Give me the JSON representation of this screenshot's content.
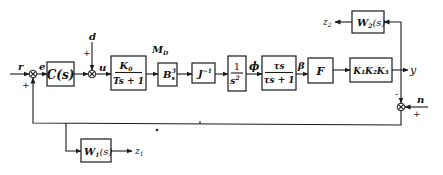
{
  "diagram": {
    "type": "control-system block diagram",
    "signals": {
      "r": "r",
      "e": "e",
      "d": "d",
      "u": "u",
      "MD": "M",
      "MD_sub": "D",
      "phi": "ϕ",
      "beta": "β",
      "y": "y",
      "n": "n",
      "z1": "z",
      "z1_sub": "1",
      "z2": "z",
      "z2_sub": "2"
    },
    "signs": {
      "sum1_fb": "+",
      "sum2_d": "+",
      "sum3_y": "-",
      "sum3_n": "+"
    },
    "blocks": {
      "controller": "C(s)",
      "actuator_num": "K",
      "actuator_num_sub": "0",
      "actuator_den": "Ts + 1",
      "Bs": "B",
      "Bs_sub": "s",
      "Bs_sup": "3",
      "Jinv": "J",
      "Jinv_sup": "−1",
      "integrator_num": "1",
      "integrator_den": "s",
      "integrator_den_sup": "2",
      "lead_num": "τs",
      "lead_den": "τs + 1",
      "F": "F",
      "gain": "K₁K₂K₃",
      "W1": "W",
      "W1_sub": "1",
      "W1_arg": "(s)",
      "W2": "W",
      "W2_sub": "2",
      "W2_arg": "(s)"
    }
  }
}
